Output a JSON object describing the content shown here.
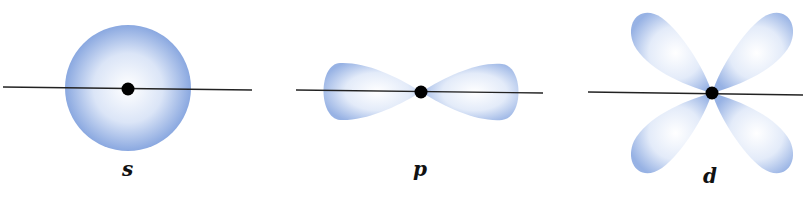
{
  "figure": {
    "orbitals": [
      {
        "id": "s",
        "label": "s",
        "shape": "sphere",
        "center": [
          128,
          90
        ]
      },
      {
        "id": "p",
        "label": "p",
        "shape": "two-lobed dumbbell",
        "center": [
          421,
          92
        ]
      },
      {
        "id": "d",
        "label": "d",
        "shape": "four-lobed cloverleaf",
        "center": [
          712,
          93
        ]
      }
    ],
    "colors": {
      "lobe_edge": "#7f9fdc",
      "lobe_center": "#ffffff",
      "axis_line": "#222222",
      "nucleus": "#000000"
    }
  }
}
